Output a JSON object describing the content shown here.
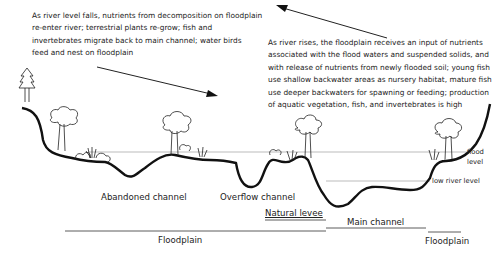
{
  "diagram": {
    "falling_note": [
      "As river level falls, nutrients from decomposition on floodplain",
      "re-enter river; terrestrial plants re-grow; fish and",
      "invertebrates migrate back to main channel; water birds",
      "feed and nest on floodplain"
    ],
    "rising_note": [
      "As river rises, the floodplain receives an input of nutrients",
      "associated with the flood waters and suspended solids, and",
      "with release of nutrients from newly flooded soil; young fish",
      "use shallow backwater areas as nursery habitat, mature fish",
      "use deeper backwaters for spawning or feeding; production",
      "of aquatic vegetation, fish, and invertebrates is high"
    ],
    "levels": {
      "flood_level": [
        "flood",
        "level"
      ],
      "low_river_level": "low river level"
    },
    "features": {
      "abandoned_channel": "Abandoned channel",
      "overflow_channel": "Overflow channel",
      "natural_levee": "Natural levee",
      "main_channel": "Main channel",
      "floodplain_left": "Floodplain",
      "floodplain_right": "Floodplain"
    },
    "colors": {
      "ground_line": "#111111",
      "level_line": "#999999",
      "text": "#222222"
    }
  }
}
